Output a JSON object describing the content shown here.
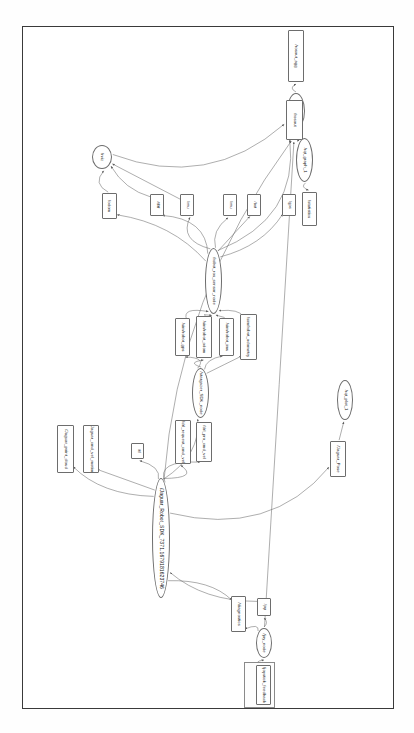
{
  "document": {
    "title": "rqt_graph ROS computation graph",
    "type": "node-graph-screenshot",
    "orientation": "rotated-90",
    "page_border_color": "#3a3a3a",
    "node_border_color": "#6d6d6d",
    "edge_color": "#6a6a6a",
    "background": "#ffffff"
  },
  "graph": {
    "node_count": 26,
    "edge_count": 48,
    "nodes": [
      {
        "id": "n_rosout_agg",
        "label": "/rosout_agg",
        "shape": "box",
        "x": 288,
        "y": 30,
        "w": 16,
        "h": 52
      },
      {
        "id": "n_rosout_node",
        "label": "/rosout",
        "shape": "ellipse",
        "x": 287,
        "y": 93,
        "w": 18,
        "h": 36
      },
      {
        "id": "n_rosout",
        "label": "/rosout",
        "shape": "box",
        "x": 286,
        "y": 100,
        "w": 17,
        "h": 40
      },
      {
        "id": "n_rqt_graph_1",
        "label": "/rqt_graph_1",
        "shape": "ellipse",
        "x": 296,
        "y": 138,
        "w": 17,
        "h": 44
      },
      {
        "id": "n_statistics",
        "label": "/statistics",
        "shape": "box",
        "x": 302,
        "y": 192,
        "w": 15,
        "h": 34
      },
      {
        "id": "n_rviz",
        "label": "/rviz",
        "shape": "ellipse",
        "x": 92,
        "y": 145,
        "w": 20,
        "h": 24
      },
      {
        "id": "n_odom",
        "label": "/odom",
        "shape": "box",
        "x": 102,
        "y": 193,
        "w": 15,
        "h": 26
      },
      {
        "id": "n_tf_tf",
        "label": "/tf/tf",
        "shape": "box",
        "x": 150,
        "y": 194,
        "w": 14,
        "h": 22
      },
      {
        "id": "n_imu_top",
        "label": "/imu",
        "shape": "box",
        "x": 180,
        "y": 194,
        "w": 14,
        "h": 22
      },
      {
        "id": "n_imu2",
        "label": "/imu",
        "shape": "box",
        "x": 223,
        "y": 194,
        "w": 14,
        "h": 22
      },
      {
        "id": "n_bat",
        "label": "/bat",
        "shape": "box",
        "x": 247,
        "y": 194,
        "w": 14,
        "h": 22
      },
      {
        "id": "n_gps",
        "label": "/gps",
        "shape": "box",
        "x": 282,
        "y": 194,
        "w": 14,
        "h": 22
      },
      {
        "id": "n_robot_ros_sensor_node",
        "label": "/robot_ros_sensor_node",
        "shape": "ellipse",
        "x": 205,
        "y": 248,
        "w": 17,
        "h": 66
      },
      {
        "id": "n_sim_robot_gps",
        "label": "/sim/robot_gps",
        "shape": "box",
        "x": 175,
        "y": 318,
        "w": 15,
        "h": 38
      },
      {
        "id": "n_sim_robot_odom",
        "label": "/sim/robot_odom",
        "shape": "box",
        "x": 196,
        "y": 316,
        "w": 16,
        "h": 42
      },
      {
        "id": "n_sim_robot_imu",
        "label": "/sim/robot_imu",
        "shape": "box",
        "x": 219,
        "y": 318,
        "w": 15,
        "h": 38
      },
      {
        "id": "n_sim_robot_odometry",
        "label": "/sim/robot_odometry",
        "shape": "box",
        "x": 240,
        "y": 314,
        "w": 17,
        "h": 46
      },
      {
        "id": "n_stargazer_sdk",
        "label": "/stargazer_SDK_node",
        "shape": "ellipse",
        "x": 192,
        "y": 368,
        "w": 17,
        "h": 50
      },
      {
        "id": "n_drl_request_cmd_vel",
        "label": "/drl_request_cmd_vel",
        "shape": "box",
        "x": 175,
        "y": 420,
        "w": 16,
        "h": 44
      },
      {
        "id": "n_drl_pro_cmd_vel",
        "label": "/drl_pro_cmd_vel",
        "shape": "box",
        "x": 196,
        "y": 422,
        "w": 16,
        "h": 40
      },
      {
        "id": "n_jaguar_point_cloud",
        "label": "/Jaguar_point_cloud",
        "shape": "box",
        "x": 57,
        "y": 425,
        "w": 17,
        "h": 48
      },
      {
        "id": "n_jaguar_cmd_vel",
        "label": "/Jaguar_cmd_vel_motion",
        "shape": "box",
        "x": 83,
        "y": 425,
        "w": 16,
        "h": 48
      },
      {
        "id": "n_tf_small",
        "label": "/tf",
        "shape": "box",
        "x": 131,
        "y": 443,
        "w": 13,
        "h": 16
      },
      {
        "id": "n_jaguar_pose",
        "label": "/Jaguar_Pose",
        "shape": "box",
        "x": 330,
        "y": 441,
        "w": 16,
        "h": 36
      },
      {
        "id": "n_rqt_plot_1",
        "label": "/rqt_plot_1",
        "shape": "ellipse",
        "x": 337,
        "y": 380,
        "w": 16,
        "h": 40
      },
      {
        "id": "n_jaguar_robot_sdk",
        "label": "/Jaguar_Robot_SDK_7371.1679181623746",
        "shape": "ellipse",
        "x": 152,
        "y": 478,
        "w": 18,
        "h": 120
      },
      {
        "id": "n_diagnostics",
        "label": "/diagnostics",
        "shape": "box",
        "x": 231,
        "y": 596,
        "w": 15,
        "h": 36
      },
      {
        "id": "n_joy_box",
        "label": "/joy",
        "shape": "box",
        "x": 257,
        "y": 598,
        "w": 14,
        "h": 18
      },
      {
        "id": "n_joy_node",
        "label": "/joy_node",
        "shape": "ellipse",
        "x": 256,
        "y": 628,
        "w": 16,
        "h": 30
      },
      {
        "id": "n_joy_group",
        "label": "/joy",
        "shape": "group",
        "x": 244,
        "y": 662,
        "w": 31,
        "h": 46
      },
      {
        "id": "n_joystick_feedback",
        "label": "/joystick_feedback",
        "shape": "box",
        "x": 256,
        "y": 665,
        "w": 15,
        "h": 40
      }
    ],
    "edges": [
      {
        "from": "n_rosout",
        "to": "n_rosout_node"
      },
      {
        "from": "n_rosout_node",
        "to": "n_rosout_agg"
      },
      {
        "from": "n_rqt_graph_1",
        "to": "n_rosout"
      },
      {
        "from": "n_rqt_graph_1",
        "to": "n_statistics"
      },
      {
        "from": "n_rviz",
        "to": "n_rosout"
      },
      {
        "from": "n_odom",
        "to": "n_rviz"
      },
      {
        "from": "n_tf_tf",
        "to": "n_rviz"
      },
      {
        "from": "n_imu_top",
        "to": "n_rviz"
      },
      {
        "from": "n_robot_ros_sensor_node",
        "to": "n_odom"
      },
      {
        "from": "n_robot_ros_sensor_node",
        "to": "n_tf_tf"
      },
      {
        "from": "n_robot_ros_sensor_node",
        "to": "n_imu_top"
      },
      {
        "from": "n_robot_ros_sensor_node",
        "to": "n_imu2"
      },
      {
        "from": "n_robot_ros_sensor_node",
        "to": "n_bat"
      },
      {
        "from": "n_robot_ros_sensor_node",
        "to": "n_gps"
      },
      {
        "from": "n_robot_ros_sensor_node",
        "to": "n_rosout"
      },
      {
        "from": "n_sim_robot_gps",
        "to": "n_robot_ros_sensor_node"
      },
      {
        "from": "n_sim_robot_odom",
        "to": "n_robot_ros_sensor_node"
      },
      {
        "from": "n_sim_robot_imu",
        "to": "n_robot_ros_sensor_node"
      },
      {
        "from": "n_sim_robot_odometry",
        "to": "n_robot_ros_sensor_node"
      },
      {
        "from": "n_stargazer_sdk",
        "to": "n_sim_robot_gps"
      },
      {
        "from": "n_stargazer_sdk",
        "to": "n_sim_robot_odom"
      },
      {
        "from": "n_stargazer_sdk",
        "to": "n_sim_robot_imu"
      },
      {
        "from": "n_stargazer_sdk",
        "to": "n_sim_robot_odometry"
      },
      {
        "from": "n_jaguar_robot_sdk",
        "to": "n_stargazer_sdk"
      },
      {
        "from": "n_jaguar_robot_sdk",
        "to": "n_drl_request_cmd_vel"
      },
      {
        "from": "n_jaguar_robot_sdk",
        "to": "n_drl_pro_cmd_vel"
      },
      {
        "from": "n_jaguar_robot_sdk",
        "to": "n_jaguar_point_cloud"
      },
      {
        "from": "n_jaguar_robot_sdk",
        "to": "n_jaguar_cmd_vel"
      },
      {
        "from": "n_jaguar_robot_sdk",
        "to": "n_tf_small"
      },
      {
        "from": "n_jaguar_robot_sdk",
        "to": "n_jaguar_pose"
      },
      {
        "from": "n_jaguar_robot_sdk",
        "to": "n_rosout"
      },
      {
        "from": "n_jaguar_robot_sdk",
        "to": "n_diagnostics"
      },
      {
        "from": "n_jaguar_pose",
        "to": "n_rqt_plot_1"
      },
      {
        "from": "n_joy_node",
        "to": "n_joy_box"
      },
      {
        "from": "n_joy_node",
        "to": "n_diagnostics"
      },
      {
        "from": "n_joystick_feedback",
        "to": "n_joy_node"
      },
      {
        "from": "n_joy_box",
        "to": "n_jaguar_robot_sdk"
      },
      {
        "from": "n_joy_node",
        "to": "n_rosout"
      }
    ]
  }
}
